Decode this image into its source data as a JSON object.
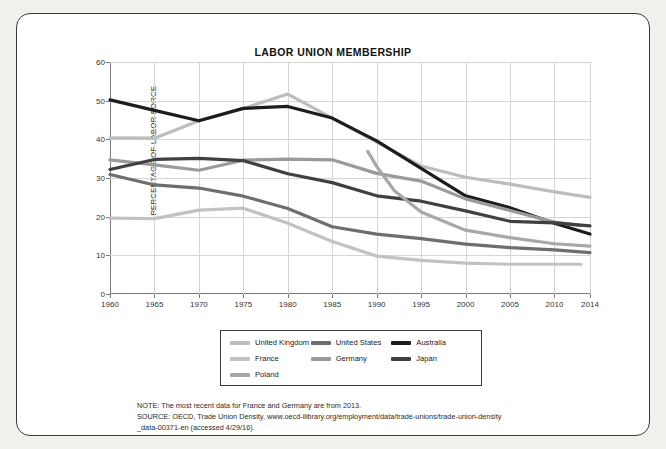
{
  "chart_data": {
    "type": "line",
    "title": "LABOR UNION MEMBERSHIP",
    "xlabel": "",
    "ylabel": "PERCENTAGE OF LABOR FORCE",
    "xlim": [
      1960,
      2014
    ],
    "ylim": [
      0,
      60
    ],
    "ytick_labels": [
      "0",
      "10",
      "20",
      "30",
      "40",
      "50",
      "60"
    ],
    "ytick_values": [
      0,
      10,
      20,
      30,
      40,
      50,
      60
    ],
    "xtick_labels": [
      "1960",
      "1965",
      "1970",
      "1975",
      "1980",
      "1985",
      "1990",
      "1995",
      "2000",
      "2005",
      "2010",
      "2014"
    ],
    "xtick_values": [
      1960,
      1965,
      1970,
      1975,
      1980,
      1985,
      1990,
      1995,
      2000,
      2005,
      2010,
      2014
    ],
    "grid": true,
    "legend_position": "bottom",
    "series": [
      {
        "name": "United Kingdom",
        "color": "#bdbdbd",
        "x": [
          1960,
          1965,
          1970,
          1975,
          1980,
          1985,
          1990,
          1995,
          2000,
          2005,
          2010,
          2014
        ],
        "values": [
          40.4,
          40.3,
          44.8,
          48.0,
          51.7,
          45.5,
          39.3,
          33.1,
          30.2,
          28.4,
          26.4,
          25.0
        ]
      },
      {
        "name": "United States",
        "color": "#6e6e6e",
        "x": [
          1960,
          1965,
          1970,
          1975,
          1980,
          1985,
          1990,
          1995,
          2000,
          2005,
          2010,
          2014
        ],
        "values": [
          30.9,
          28.2,
          27.4,
          25.3,
          22.1,
          17.4,
          15.5,
          14.3,
          12.9,
          12.0,
          11.4,
          10.7
        ]
      },
      {
        "name": "Australia",
        "color": "#1c1c1c",
        "x": [
          1960,
          1965,
          1970,
          1975,
          1980,
          1985,
          1990,
          1995,
          2000,
          2005,
          2010,
          2014
        ],
        "values": [
          50.2,
          47.5,
          44.8,
          48.0,
          48.5,
          45.5,
          39.6,
          32.5,
          25.4,
          22.3,
          18.3,
          15.5
        ]
      },
      {
        "name": "France",
        "color": "#c2c2c2",
        "x": [
          1960,
          1965,
          1970,
          1975,
          1980,
          1985,
          1990,
          1995,
          2000,
          2005,
          2010,
          2013
        ],
        "values": [
          19.6,
          19.5,
          21.7,
          22.2,
          18.3,
          13.6,
          9.8,
          8.7,
          8.0,
          7.7,
          7.7,
          7.7
        ]
      },
      {
        "name": "Germany",
        "color": "#9a9a9a",
        "x": [
          1960,
          1965,
          1970,
          1975,
          1980,
          1985,
          1990,
          1995,
          2000,
          2005,
          2010,
          2013
        ],
        "values": [
          34.7,
          33.4,
          32.0,
          34.6,
          34.9,
          34.7,
          31.2,
          29.2,
          24.6,
          21.6,
          18.6,
          17.7
        ]
      },
      {
        "name": "Japan",
        "color": "#404040",
        "x": [
          1960,
          1965,
          1970,
          1975,
          1980,
          1985,
          1990,
          1995,
          2000,
          2005,
          2010,
          2014
        ],
        "values": [
          32.2,
          34.8,
          35.1,
          34.5,
          31.1,
          28.8,
          25.4,
          24.0,
          21.5,
          18.8,
          18.4,
          17.6
        ]
      },
      {
        "name": "Poland",
        "color": "#a8a8a8",
        "x": [
          1989,
          1990,
          1992,
          1995,
          2000,
          2005,
          2010,
          2014
        ],
        "values": [
          36.9,
          33.0,
          26.7,
          21.2,
          16.5,
          14.6,
          13.0,
          12.4
        ]
      }
    ]
  },
  "legend": {
    "items": [
      {
        "label": "United Kingdom",
        "color": "#bdbdbd"
      },
      {
        "label": "United States",
        "color": "#6e6e6e"
      },
      {
        "label": "Australia",
        "color": "#1c1c1c"
      },
      {
        "label": "France",
        "color": "#c2c2c2"
      },
      {
        "label": "Germany",
        "color": "#9a9a9a"
      },
      {
        "label": "Japan",
        "color": "#404040"
      },
      {
        "label": "Poland",
        "color": "#a8a8a8"
      }
    ]
  },
  "notes": {
    "line1": "NOTE: The most recent data for France and Germany are from 2013.",
    "line2": "SOURCE: OECD, Trade Union Density, www.oecd-ilibrary.org/employment/data/trade-unions/trade-union-density",
    "line3": "_data-00371-en (accessed 4/29/16)."
  }
}
